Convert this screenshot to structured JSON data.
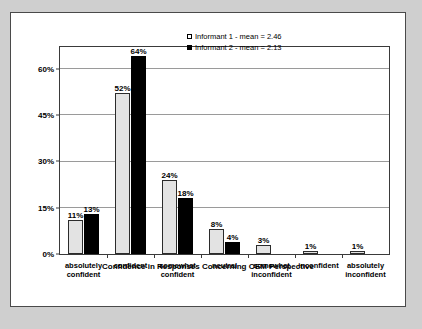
{
  "figure": {
    "x_axis_title": "Confidence in Responses Concerning OEM Perspective"
  },
  "legend": {
    "items": [
      {
        "label": "Informant 1 - mean = 2.46",
        "marker": "open-square",
        "color": "#e3e3e3"
      },
      {
        "label": "Informant 2 - mean = 2.13",
        "marker": "filled-square",
        "color": "#000000"
      }
    ]
  },
  "chart_data": {
    "type": "bar",
    "title": "",
    "xlabel": "Confidence in Responses Concerning OEM Perspective",
    "ylabel": "",
    "ylim": [
      0,
      67
    ],
    "yticks": [
      "0%",
      "15%",
      "30%",
      "45%",
      "60%"
    ],
    "ytick_values": [
      0,
      15,
      30,
      45,
      60
    ],
    "grid": true,
    "legend_position": "top-right",
    "categories": [
      "absolutely confident",
      "confident",
      "somewhat confident",
      "neutral",
      "somewhat inconfident",
      "inconfident",
      "absolutely inconfident"
    ],
    "series": [
      {
        "name": "Informant 1 - mean = 2.46",
        "mean": 2.46,
        "values": [
          11,
          52,
          24,
          8,
          3,
          1,
          1
        ],
        "labels": [
          "11%",
          "52%",
          "24%",
          "8%",
          "3%",
          "1%",
          "1%"
        ]
      },
      {
        "name": "Informant 2 - mean = 2.13",
        "mean": 2.13,
        "values": [
          13,
          64,
          18,
          4,
          0,
          0,
          0
        ],
        "labels": [
          "13%",
          "64%",
          "18%",
          "4%",
          "",
          "",
          ""
        ]
      }
    ]
  }
}
